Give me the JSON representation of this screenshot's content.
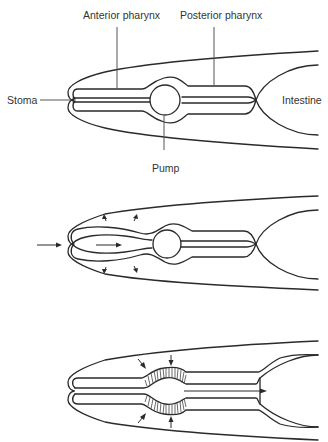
{
  "figure": {
    "panels": [
      {
        "id": "panel-1",
        "description": "Pharynx at rest",
        "labels": {
          "anterior_pharynx": "Anterior pharynx",
          "posterior_pharynx": "Posterior pharynx",
          "stoma": "Stoma",
          "intestine": "Intestine",
          "pump": "Pump"
        }
      },
      {
        "id": "panel-2",
        "description": "Anterior pharynx opens, fluid drawn in through stoma",
        "arrows": [
          "inflow-left",
          "lumen-flow-right",
          "dilation-up",
          "dilation-down"
        ]
      },
      {
        "id": "panel-3",
        "description": "Pump (terminal bulb) contracts, food pushed to intestine",
        "arrows": [
          "pump-compression-top",
          "pump-compression-bottom",
          "flow-to-intestine"
        ]
      }
    ],
    "colors": {
      "line": "#2a2a2a",
      "leader": "#555555",
      "text": "#333333",
      "background": "#ffffff"
    }
  }
}
